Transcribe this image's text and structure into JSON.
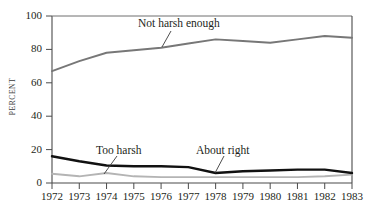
{
  "chart_data": {
    "type": "line",
    "title": "",
    "xlabel": "",
    "ylabel": "PERCENT",
    "categories": [
      "1972",
      "1973",
      "1974",
      "1975",
      "1976",
      "1977",
      "1978",
      "1979",
      "1980",
      "1981",
      "1982",
      "1983"
    ],
    "x": [
      1972,
      1973,
      1974,
      1975,
      1976,
      1977,
      1978,
      1979,
      1980,
      1981,
      1982,
      1983
    ],
    "xlim": [
      1972,
      1983
    ],
    "ylim": [
      0,
      100
    ],
    "yticks": [
      0,
      20,
      40,
      60,
      80,
      100
    ],
    "ytick_labels": [
      "0",
      "20",
      "40",
      "60",
      "80",
      "100"
    ],
    "xtick_labels": [
      "1972",
      "1973",
      "1974",
      "1975",
      "1976",
      "1977",
      "1978",
      "1979",
      "1980",
      "1981",
      "1982",
      "1983"
    ],
    "grid": false,
    "legend": "annotations-inline",
    "series": [
      {
        "name": "Not harsh enough",
        "color": "#777777",
        "values": [
          67,
          73,
          78,
          79.5,
          81,
          83.5,
          86,
          85,
          84,
          86,
          88,
          87
        ]
      },
      {
        "name": "About right",
        "color": "#111111",
        "values": [
          16,
          13,
          10.5,
          10,
          10,
          9.5,
          6,
          7,
          7.5,
          8,
          8,
          6
        ]
      },
      {
        "name": "Too harsh",
        "color": "#b4b4b4",
        "values": [
          5.5,
          4,
          6,
          4,
          3.5,
          3.5,
          3.5,
          3.5,
          3.5,
          3.5,
          4,
          5
        ]
      }
    ],
    "annotations": [
      {
        "text": "Not harsh enough",
        "series": "Not harsh enough",
        "x": 1976
      },
      {
        "text": "Too harsh",
        "series": "Too harsh",
        "x": 1974
      },
      {
        "text": "About right",
        "series": "About right",
        "x": 1978
      }
    ],
    "colors": {
      "not_harsh_enough": "#777777",
      "about_right": "#111111",
      "too_harsh": "#b4b4b4",
      "axis": "#4a4a4a",
      "text": "#231f20",
      "background": "#ffffff"
    }
  },
  "axis": {
    "y_title": "PERCENT",
    "y_ticks": [
      "100",
      "80",
      "60",
      "40",
      "20",
      "0"
    ],
    "x_ticks": [
      "1972",
      "1973",
      "1974",
      "1975",
      "1976",
      "1977",
      "1978",
      "1979",
      "1980",
      "1981",
      "1982",
      "1983"
    ]
  },
  "annotations": {
    "not_harsh_enough": "Not harsh enough",
    "too_harsh": "Too harsh",
    "about_right": "About right"
  }
}
